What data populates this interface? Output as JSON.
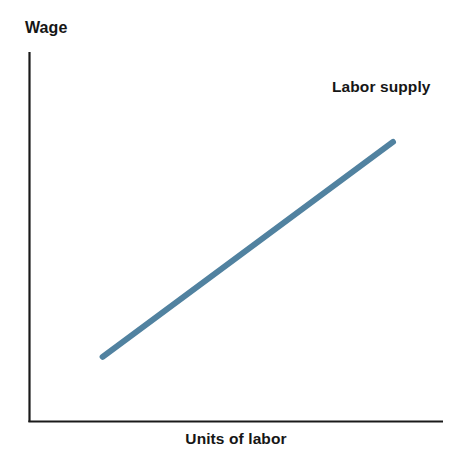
{
  "figure": {
    "width": 476,
    "height": 450,
    "background": "#ffffff"
  },
  "chart_data": {
    "type": "line",
    "title": "",
    "subtitle": "",
    "xlabel": "Units of labor",
    "ylabel": "Wage",
    "grid": false,
    "legend_position": "inline-right-of-line-end",
    "axis_color": "#1a1a1a",
    "axis_style": "two-sided L-shaped spines, no tick marks, no tick labels",
    "xlim": [
      0,
      1
    ],
    "ylim": [
      0,
      1
    ],
    "xticks": [],
    "yticks": [],
    "xticklabels": [],
    "yticklabels": [],
    "annotations": [
      {
        "name": "labor-supply-label",
        "text": "Labor supply",
        "x": 0.735,
        "y": 0.875
      }
    ],
    "series": [
      {
        "name": "Labor supply",
        "label": "Labor supply",
        "color": "#5182a0",
        "linewidth": 6,
        "x": [
          0.101,
          1.0
        ],
        "y": [
          0.1,
          0.862
        ],
        "description": "Upward-sloping straight line: wage rises with units of labor supplied",
        "points": [
          {
            "x": 0.101,
            "y": 0.1
          },
          {
            "x": 0.326,
            "y": 0.29
          },
          {
            "x": 0.551,
            "y": 0.481
          },
          {
            "x": 0.776,
            "y": 0.671
          },
          {
            "x": 1.0,
            "y": 0.862
          }
        ]
      }
    ]
  },
  "labels": {
    "y_axis_title": "Wage",
    "x_axis_title": "Units of labor",
    "labor_supply": "Labor supply"
  },
  "colors": {
    "line": "#5182a0",
    "axis": "#1a1a1a",
    "text": "#161616",
    "background": "#ffffff"
  }
}
